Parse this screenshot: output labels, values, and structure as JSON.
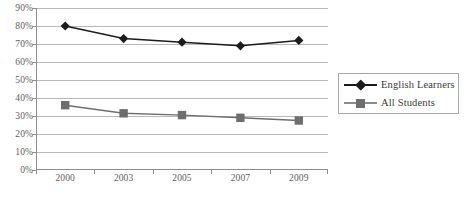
{
  "chart_data": {
    "type": "line",
    "title": "",
    "subtitle": "",
    "xlabel": "",
    "ylabel": "",
    "categories": [
      "2000",
      "2003",
      "2005",
      "2007",
      "2009"
    ],
    "series": [
      {
        "name": "English Learners",
        "marker": "diamond",
        "color": "#1c1c1c",
        "values": [
          80,
          73,
          71,
          69,
          72
        ]
      },
      {
        "name": "All Students",
        "marker": "square",
        "color": "#6e6e6e",
        "values": [
          36,
          31.5,
          30.5,
          29,
          27.5
        ]
      }
    ],
    "ylim": [
      0,
      90
    ],
    "ytick_step": 10,
    "ytick_labels": [
      "90%",
      "80%",
      "70%",
      "60%",
      "50%",
      "40%",
      "30%",
      "20%",
      "10%",
      "0%"
    ],
    "ytick_values": [
      90,
      80,
      70,
      60,
      50,
      40,
      30,
      20,
      10,
      0
    ],
    "grid": true,
    "grid_axis": "y",
    "legend_position": "right",
    "value_format": "percent"
  },
  "legend": {
    "entries": [
      {
        "label": "English Learners"
      },
      {
        "label": "All Students"
      }
    ]
  },
  "caption": {
    "text": ""
  },
  "colors": {
    "series_english_learners": "#1c1c1c",
    "series_all_students": "#6e6e6e",
    "gridline": "#b9b9b9",
    "axis": "#8d8d8d",
    "tick_label": "#5d5d5d",
    "legend_border": "#a8a8a8",
    "background": "#ffffff"
  }
}
